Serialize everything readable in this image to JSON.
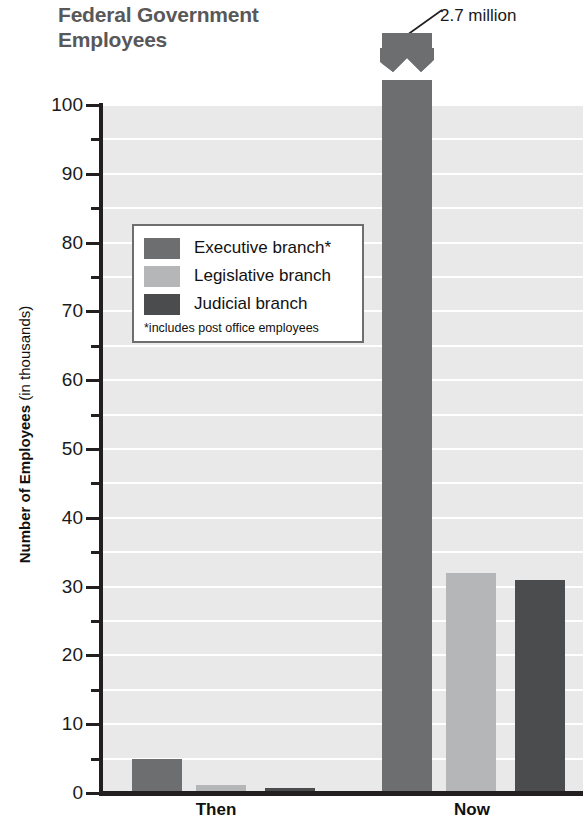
{
  "title": {
    "line1": "Federal Government",
    "line2": "Employees"
  },
  "callout": {
    "label": "2.7 million"
  },
  "legend": {
    "items": [
      {
        "label": "Executive branch*",
        "color": "#6d6e70",
        "key": "executive"
      },
      {
        "label": "Legislative branch",
        "color": "#b5b6b8",
        "key": "legislative"
      },
      {
        "label": "Judicial branch",
        "color": "#4b4c4e",
        "key": "judicial"
      }
    ],
    "footnote": "*includes post office employees"
  },
  "axis": {
    "y_title_strong": "Number of Employees",
    "y_title_regular": " (in thousands)",
    "y_ticks": [
      "0",
      "10",
      "20",
      "30",
      "40",
      "50",
      "60",
      "70",
      "80",
      "90",
      "100"
    ],
    "x_ticks": [
      "Then",
      "Now"
    ]
  },
  "chart_data": {
    "type": "bar",
    "title": "Federal Government Employees",
    "xlabel": "",
    "ylabel": "Number of Employees (in thousands)",
    "ylim": [
      0,
      100
    ],
    "y_tick_interval": 10,
    "y_minor_tick_interval": 5,
    "grid": true,
    "grid_orientation": "horizontal",
    "legend_position": "inside-upper-left",
    "categories": [
      "Then",
      "Now"
    ],
    "series": [
      {
        "name": "Executive branch*",
        "color": "#6d6e70",
        "values": [
          5,
          2700
        ],
        "display_values": [
          "5",
          "2.7 million"
        ],
        "note": "Now value exceeds axis; bar drawn with axis break"
      },
      {
        "name": "Legislative branch",
        "color": "#b5b6b8",
        "values": [
          1.2,
          32
        ]
      },
      {
        "name": "Judicial branch",
        "color": "#4b4c4e",
        "values": [
          0.8,
          31
        ]
      }
    ],
    "annotations": [
      {
        "text": "2.7 million",
        "target_series": "Executive branch*",
        "target_category": "Now",
        "type": "leader-line-label"
      },
      {
        "text": "*includes post office employees",
        "type": "footnote"
      }
    ],
    "axis_break": {
      "series": "Executive branch*",
      "category": "Now",
      "style": "zigzag"
    }
  },
  "colors": {
    "plot_background": "#e9e9e9",
    "gridline": "#ffffff",
    "axis": "#231f20",
    "title_text": "#58585a"
  }
}
